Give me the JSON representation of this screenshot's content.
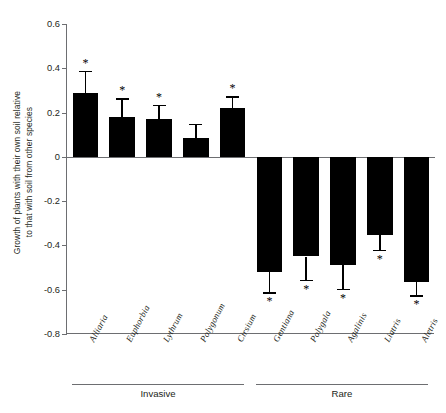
{
  "chart_data": {
    "type": "bar",
    "title": "",
    "xlabel": "",
    "ylabel": "Growth of plants with their own soil relative\nto that with soil from other species",
    "ylim": [
      -0.8,
      0.6
    ],
    "yticks": [
      0.6,
      0.4,
      0.2,
      0,
      -0.2,
      -0.4,
      -0.6,
      -0.8
    ],
    "ytick_labels": [
      "0.6",
      "0.4",
      "0.2",
      "0",
      "-0.2",
      "-0.4",
      "-0.6",
      "-0.8"
    ],
    "grid": false,
    "legend": "none",
    "categories": [
      "Alliaria",
      "Euphorbia",
      "Lythrum",
      "Polygonum",
      "Cirsium",
      "Gentiana",
      "Polygala",
      "Agalinis",
      "Liatris",
      "Aletris"
    ],
    "values": [
      0.29,
      0.18,
      0.17,
      0.085,
      0.22,
      -0.52,
      -0.45,
      -0.49,
      -0.355,
      -0.565
    ],
    "errors": [
      0.1,
      0.085,
      0.065,
      0.065,
      0.055,
      0.09,
      0.105,
      0.105,
      0.065,
      0.06
    ],
    "significance": [
      "*",
      "*",
      "*",
      "",
      "*",
      "*",
      "*",
      "*",
      "*",
      "*"
    ],
    "groups": [
      {
        "label": "Invasive",
        "categories": [
          "Alliaria",
          "Euphorbia",
          "Lythrum",
          "Polygonum",
          "Cirsium"
        ]
      },
      {
        "label": "Rare",
        "categories": [
          "Gentiana",
          "Polygala",
          "Agalinis",
          "Liatris",
          "Aletris"
        ]
      }
    ],
    "bar_color": "#000000",
    "axis_color": "#6d6e71",
    "zero_reference": 0
  }
}
